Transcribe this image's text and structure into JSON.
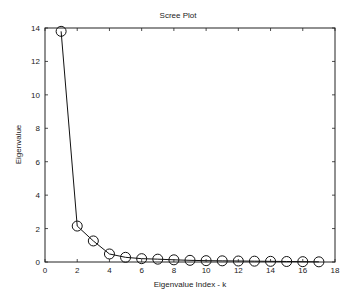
{
  "chart_data": {
    "type": "line",
    "title": "Scree Plot",
    "xlabel": "Eigenvalue Index - k",
    "ylabel": "Eigenvalue",
    "xlim": [
      0,
      18
    ],
    "ylim": [
      0,
      14
    ],
    "xticks": [
      0,
      2,
      4,
      6,
      8,
      10,
      12,
      14,
      16,
      18
    ],
    "yticks": [
      0,
      2,
      4,
      6,
      8,
      10,
      12,
      14
    ],
    "grid": false,
    "legend": null,
    "marker": "open-circle",
    "series": [
      {
        "name": "Eigenvalues",
        "x": [
          1,
          2,
          3,
          4,
          5,
          6,
          7,
          8,
          9,
          10,
          11,
          12,
          13,
          14,
          15,
          16,
          17
        ],
        "values": [
          13.8,
          2.15,
          1.26,
          0.48,
          0.28,
          0.2,
          0.17,
          0.13,
          0.1,
          0.08,
          0.07,
          0.06,
          0.05,
          0.04,
          0.03,
          0.02,
          0.01
        ]
      }
    ]
  }
}
